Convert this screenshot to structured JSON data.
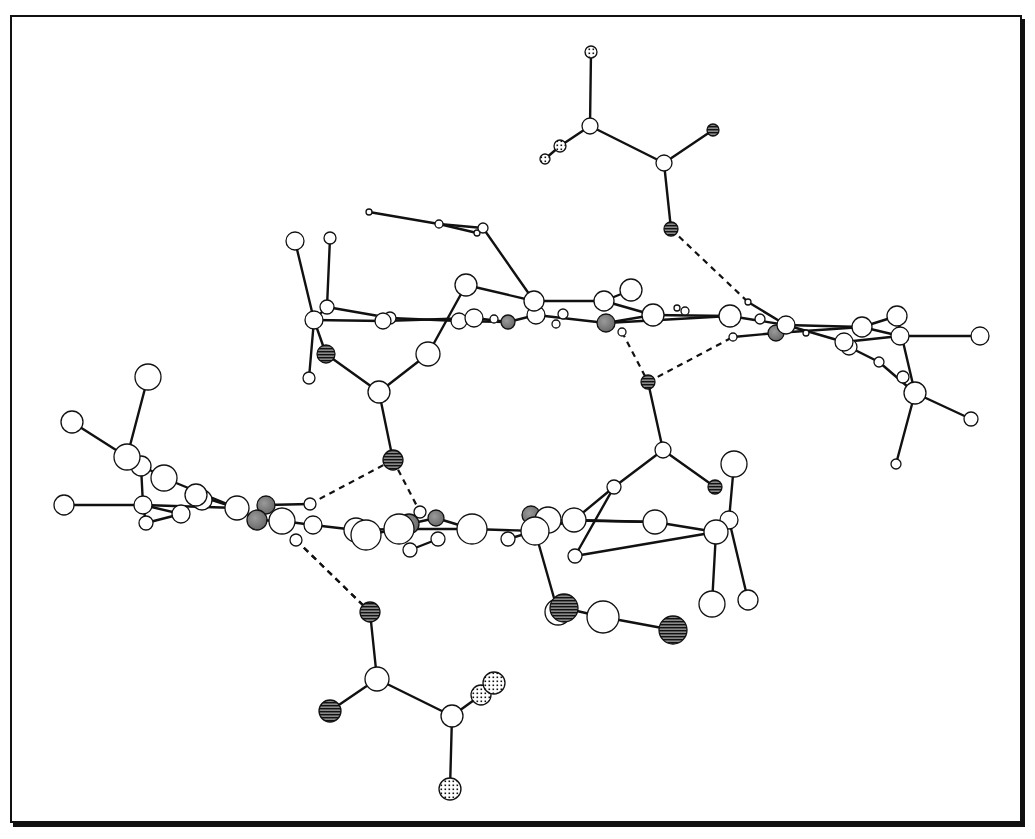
{
  "figure": {
    "caption_fragment": "",
    "colors": {
      "bond": "#111111",
      "atom_fill_plain": "#ffffff",
      "atom_fill_metal": "#7a7a7a",
      "atom_stroke": "#111111",
      "hatch": "#111111",
      "frame": "#111111",
      "hbond": "#111111"
    },
    "legend_atom_types": [
      "plain (C/N/H)",
      "shaded (metal/N)",
      "hatched (O)",
      "dotted (F/halogen)"
    ]
  },
  "atoms": [
    {
      "id": "a1",
      "x": 591,
      "y": 52,
      "r": 6,
      "type": "dotted"
    },
    {
      "id": "a2",
      "x": 590,
      "y": 126,
      "r": 8,
      "type": "plain"
    },
    {
      "id": "a3",
      "x": 560,
      "y": 146,
      "r": 6,
      "type": "dotted"
    },
    {
      "id": "a4",
      "x": 545,
      "y": 159,
      "r": 5,
      "type": "dotted"
    },
    {
      "id": "a5",
      "x": 664,
      "y": 163,
      "r": 8,
      "type": "plain"
    },
    {
      "id": "a6",
      "x": 713,
      "y": 130,
      "r": 6,
      "type": "hatched"
    },
    {
      "id": "a7",
      "x": 671,
      "y": 229,
      "r": 7,
      "type": "hatched"
    },
    {
      "id": "b1",
      "x": 369,
      "y": 212,
      "r": 3,
      "type": "plain"
    },
    {
      "id": "b2",
      "x": 439,
      "y": 224,
      "r": 4,
      "type": "plain"
    },
    {
      "id": "b3",
      "x": 483,
      "y": 228,
      "r": 5,
      "type": "plain"
    },
    {
      "id": "b4",
      "x": 477,
      "y": 233,
      "r": 3,
      "type": "plain"
    },
    {
      "id": "c1",
      "x": 295,
      "y": 241,
      "r": 9,
      "type": "plain"
    },
    {
      "id": "c2",
      "x": 330,
      "y": 238,
      "r": 6,
      "type": "plain"
    },
    {
      "id": "c3",
      "x": 314,
      "y": 320,
      "r": 9,
      "type": "plain"
    },
    {
      "id": "c4",
      "x": 327,
      "y": 307,
      "r": 7,
      "type": "plain"
    },
    {
      "id": "c5",
      "x": 383,
      "y": 321,
      "r": 8,
      "type": "plain"
    },
    {
      "id": "c6",
      "x": 390,
      "y": 318,
      "r": 6,
      "type": "plain"
    },
    {
      "id": "c7",
      "x": 466,
      "y": 285,
      "r": 11,
      "type": "plain"
    },
    {
      "id": "c8",
      "x": 459,
      "y": 321,
      "r": 8,
      "type": "plain"
    },
    {
      "id": "c9",
      "x": 474,
      "y": 318,
      "r": 9,
      "type": "plain"
    },
    {
      "id": "c10",
      "x": 494,
      "y": 319,
      "r": 4,
      "type": "plain"
    },
    {
      "id": "c11",
      "x": 508,
      "y": 322,
      "r": 7,
      "type": "metal"
    },
    {
      "id": "c12",
      "x": 534,
      "y": 301,
      "r": 10,
      "type": "plain"
    },
    {
      "id": "c13",
      "x": 536,
      "y": 315,
      "r": 9,
      "type": "plain"
    },
    {
      "id": "c14",
      "x": 556,
      "y": 324,
      "r": 4,
      "type": "plain"
    },
    {
      "id": "c15",
      "x": 563,
      "y": 314,
      "r": 5,
      "type": "plain"
    },
    {
      "id": "c16",
      "x": 604,
      "y": 301,
      "r": 10,
      "type": "plain"
    },
    {
      "id": "c17",
      "x": 631,
      "y": 290,
      "r": 11,
      "type": "plain"
    },
    {
      "id": "c18",
      "x": 606,
      "y": 323,
      "r": 9,
      "type": "metal"
    },
    {
      "id": "c19",
      "x": 622,
      "y": 332,
      "r": 4,
      "type": "plain"
    },
    {
      "id": "c20",
      "x": 653,
      "y": 315,
      "r": 11,
      "type": "plain"
    },
    {
      "id": "c21",
      "x": 677,
      "y": 308,
      "r": 3,
      "type": "plain"
    },
    {
      "id": "c22",
      "x": 685,
      "y": 311,
      "r": 4,
      "type": "plain"
    },
    {
      "id": "c23",
      "x": 730,
      "y": 316,
      "r": 11,
      "type": "plain"
    },
    {
      "id": "c24",
      "x": 748,
      "y": 302,
      "r": 3,
      "type": "plain"
    },
    {
      "id": "c25",
      "x": 760,
      "y": 319,
      "r": 5,
      "type": "plain"
    },
    {
      "id": "c26",
      "x": 776,
      "y": 333,
      "r": 8,
      "type": "metal"
    },
    {
      "id": "c27",
      "x": 786,
      "y": 325,
      "r": 9,
      "type": "plain"
    },
    {
      "id": "c28",
      "x": 733,
      "y": 337,
      "r": 4,
      "type": "plain"
    },
    {
      "id": "c29",
      "x": 806,
      "y": 333,
      "r": 3,
      "type": "plain"
    },
    {
      "id": "c30",
      "x": 862,
      "y": 327,
      "r": 10,
      "type": "plain"
    },
    {
      "id": "c31",
      "x": 897,
      "y": 316,
      "r": 10,
      "type": "plain"
    },
    {
      "id": "c32",
      "x": 900,
      "y": 336,
      "r": 9,
      "type": "plain"
    },
    {
      "id": "c33",
      "x": 844,
      "y": 342,
      "r": 9,
      "type": "plain"
    },
    {
      "id": "c34",
      "x": 849,
      "y": 347,
      "r": 8,
      "type": "plain"
    },
    {
      "id": "c35",
      "x": 879,
      "y": 362,
      "r": 5,
      "type": "plain"
    },
    {
      "id": "c36",
      "x": 903,
      "y": 377,
      "r": 6,
      "type": "plain"
    },
    {
      "id": "c37",
      "x": 915,
      "y": 393,
      "r": 11,
      "type": "plain"
    },
    {
      "id": "c38",
      "x": 980,
      "y": 336,
      "r": 9,
      "type": "plain"
    },
    {
      "id": "c39",
      "x": 971,
      "y": 419,
      "r": 7,
      "type": "plain"
    },
    {
      "id": "c40",
      "x": 896,
      "y": 464,
      "r": 5,
      "type": "plain"
    },
    {
      "id": "d1",
      "x": 326,
      "y": 354,
      "r": 9,
      "type": "hatched"
    },
    {
      "id": "d2",
      "x": 309,
      "y": 378,
      "r": 6,
      "type": "plain"
    },
    {
      "id": "d3",
      "x": 428,
      "y": 354,
      "r": 12,
      "type": "plain"
    },
    {
      "id": "d4",
      "x": 379,
      "y": 392,
      "r": 11,
      "type": "plain"
    },
    {
      "id": "d5",
      "x": 393,
      "y": 460,
      "r": 10,
      "type": "hatched"
    },
    {
      "id": "d6",
      "x": 648,
      "y": 382,
      "r": 7,
      "type": "hatched"
    },
    {
      "id": "d7",
      "x": 663,
      "y": 450,
      "r": 8,
      "type": "plain"
    },
    {
      "id": "d8",
      "x": 614,
      "y": 487,
      "r": 7,
      "type": "plain"
    },
    {
      "id": "d9",
      "x": 715,
      "y": 487,
      "r": 7,
      "type": "hatched"
    },
    {
      "id": "d10",
      "x": 734,
      "y": 464,
      "r": 13,
      "type": "plain"
    },
    {
      "id": "e1",
      "x": 148,
      "y": 377,
      "r": 13,
      "type": "plain"
    },
    {
      "id": "e2",
      "x": 72,
      "y": 422,
      "r": 11,
      "type": "plain"
    },
    {
      "id": "e3",
      "x": 127,
      "y": 457,
      "r": 13,
      "type": "plain"
    },
    {
      "id": "e4",
      "x": 141,
      "y": 466,
      "r": 10,
      "type": "plain"
    },
    {
      "id": "e5",
      "x": 164,
      "y": 478,
      "r": 13,
      "type": "plain"
    },
    {
      "id": "e6",
      "x": 196,
      "y": 495,
      "r": 11,
      "type": "plain"
    },
    {
      "id": "e7",
      "x": 202,
      "y": 500,
      "r": 10,
      "type": "plain"
    },
    {
      "id": "e8",
      "x": 64,
      "y": 505,
      "r": 10,
      "type": "plain"
    },
    {
      "id": "e9",
      "x": 143,
      "y": 505,
      "r": 9,
      "type": "plain"
    },
    {
      "id": "e10",
      "x": 181,
      "y": 514,
      "r": 9,
      "type": "plain"
    },
    {
      "id": "e11",
      "x": 146,
      "y": 523,
      "r": 7,
      "type": "plain"
    },
    {
      "id": "e12",
      "x": 237,
      "y": 508,
      "r": 12,
      "type": "plain"
    },
    {
      "id": "e13",
      "x": 266,
      "y": 505,
      "r": 9,
      "type": "metal"
    },
    {
      "id": "e14",
      "x": 257,
      "y": 520,
      "r": 10,
      "type": "metal"
    },
    {
      "id": "e15",
      "x": 282,
      "y": 521,
      "r": 13,
      "type": "plain"
    },
    {
      "id": "e16",
      "x": 310,
      "y": 504,
      "r": 6,
      "type": "plain"
    },
    {
      "id": "e17",
      "x": 296,
      "y": 540,
      "r": 6,
      "type": "plain"
    },
    {
      "id": "e18",
      "x": 313,
      "y": 525,
      "r": 9,
      "type": "plain"
    },
    {
      "id": "e19",
      "x": 356,
      "y": 530,
      "r": 12,
      "type": "plain"
    },
    {
      "id": "e20",
      "x": 366,
      "y": 535,
      "r": 15,
      "type": "plain"
    },
    {
      "id": "e21",
      "x": 399,
      "y": 529,
      "r": 15,
      "type": "plain"
    },
    {
      "id": "e22",
      "x": 409,
      "y": 524,
      "r": 10,
      "type": "metal"
    },
    {
      "id": "e23",
      "x": 420,
      "y": 512,
      "r": 6,
      "type": "plain"
    },
    {
      "id": "e24",
      "x": 436,
      "y": 518,
      "r": 8,
      "type": "metal"
    },
    {
      "id": "e25",
      "x": 438,
      "y": 539,
      "r": 7,
      "type": "plain"
    },
    {
      "id": "e26",
      "x": 410,
      "y": 550,
      "r": 7,
      "type": "plain"
    },
    {
      "id": "e27",
      "x": 472,
      "y": 529,
      "r": 15,
      "type": "plain"
    },
    {
      "id": "e28",
      "x": 508,
      "y": 539,
      "r": 7,
      "type": "plain"
    },
    {
      "id": "e29",
      "x": 531,
      "y": 515,
      "r": 9,
      "type": "metal"
    },
    {
      "id": "e30",
      "x": 548,
      "y": 520,
      "r": 13,
      "type": "plain"
    },
    {
      "id": "e31",
      "x": 535,
      "y": 531,
      "r": 14,
      "type": "plain"
    },
    {
      "id": "e32",
      "x": 574,
      "y": 520,
      "r": 12,
      "type": "plain"
    },
    {
      "id": "e33",
      "x": 575,
      "y": 556,
      "r": 7,
      "type": "plain"
    },
    {
      "id": "e34",
      "x": 655,
      "y": 522,
      "r": 12,
      "type": "plain"
    },
    {
      "id": "e35",
      "x": 729,
      "y": 520,
      "r": 9,
      "type": "plain"
    },
    {
      "id": "e36",
      "x": 716,
      "y": 532,
      "r": 12,
      "type": "plain"
    },
    {
      "id": "e37",
      "x": 712,
      "y": 604,
      "r": 13,
      "type": "plain"
    },
    {
      "id": "e38",
      "x": 748,
      "y": 600,
      "r": 10,
      "type": "plain"
    },
    {
      "id": "f1",
      "x": 558,
      "y": 612,
      "r": 13,
      "type": "plain"
    },
    {
      "id": "f2",
      "x": 564,
      "y": 608,
      "r": 14,
      "type": "hatched"
    },
    {
      "id": "f3",
      "x": 603,
      "y": 617,
      "r": 16,
      "type": "plain"
    },
    {
      "id": "f4",
      "x": 673,
      "y": 630,
      "r": 14,
      "type": "hatched"
    },
    {
      "id": "g1",
      "x": 370,
      "y": 612,
      "r": 10,
      "type": "hatched"
    },
    {
      "id": "g2",
      "x": 377,
      "y": 679,
      "r": 12,
      "type": "plain"
    },
    {
      "id": "g3",
      "x": 330,
      "y": 711,
      "r": 11,
      "type": "hatched"
    },
    {
      "id": "g4",
      "x": 452,
      "y": 716,
      "r": 11,
      "type": "plain"
    },
    {
      "id": "g5",
      "x": 481,
      "y": 695,
      "r": 10,
      "type": "dotted"
    },
    {
      "id": "g6",
      "x": 494,
      "y": 683,
      "r": 11,
      "type": "dotted"
    },
    {
      "id": "g7",
      "x": 450,
      "y": 789,
      "r": 11,
      "type": "dotted"
    }
  ],
  "bonds": [
    [
      "a1",
      "a2"
    ],
    [
      "a2",
      "a3"
    ],
    [
      "a3",
      "a4"
    ],
    [
      "a2",
      "a5"
    ],
    [
      "a5",
      "a6"
    ],
    [
      "a5",
      "a7"
    ],
    [
      "b1",
      "b2"
    ],
    [
      "b2",
      "b3"
    ],
    [
      "b2",
      "b4"
    ],
    [
      "b3",
      "c12"
    ],
    [
      "c1",
      "c3"
    ],
    [
      "c2",
      "c4"
    ],
    [
      "c3",
      "c4"
    ],
    [
      "c3",
      "c5"
    ],
    [
      "c4",
      "c6"
    ],
    [
      "c3",
      "d1"
    ],
    [
      "d1",
      "d4"
    ],
    [
      "d2",
      "c3"
    ],
    [
      "c5",
      "c9"
    ],
    [
      "c6",
      "c8"
    ],
    [
      "c8",
      "c11"
    ],
    [
      "c9",
      "c11"
    ],
    [
      "c7",
      "c12"
    ],
    [
      "c7",
      "d3"
    ],
    [
      "d3",
      "d4"
    ],
    [
      "d4",
      "d5"
    ],
    [
      "c12",
      "c16"
    ],
    [
      "c13",
      "c18"
    ],
    [
      "c11",
      "c13"
    ],
    [
      "c16",
      "c20"
    ],
    [
      "c17",
      "c16"
    ],
    [
      "c18",
      "c20"
    ],
    [
      "c18",
      "c23"
    ],
    [
      "c20",
      "c23"
    ],
    [
      "c23",
      "c27"
    ],
    [
      "c24",
      "c27"
    ],
    [
      "c28",
      "c26"
    ],
    [
      "c26",
      "c30"
    ],
    [
      "c27",
      "c30"
    ],
    [
      "c27",
      "c33"
    ],
    [
      "c30",
      "c31"
    ],
    [
      "c30",
      "c32"
    ],
    [
      "c32",
      "c38"
    ],
    [
      "c33",
      "c32"
    ],
    [
      "c34",
      "c35"
    ],
    [
      "c35",
      "c37"
    ],
    [
      "c31",
      "c37"
    ],
    [
      "c37",
      "c39"
    ],
    [
      "c37",
      "c40"
    ],
    [
      "d6",
      "d7"
    ],
    [
      "d7",
      "d8"
    ],
    [
      "d7",
      "d9"
    ],
    [
      "d8",
      "e32"
    ],
    [
      "d8",
      "e33"
    ],
    [
      "d10",
      "e35"
    ],
    [
      "e1",
      "e3"
    ],
    [
      "e2",
      "e3"
    ],
    [
      "e3",
      "e5"
    ],
    [
      "e4",
      "e9"
    ],
    [
      "e5",
      "e12"
    ],
    [
      "e6",
      "e12"
    ],
    [
      "e8",
      "e9"
    ],
    [
      "e9",
      "e10"
    ],
    [
      "e9",
      "e12"
    ],
    [
      "e9",
      "e11"
    ],
    [
      "e10",
      "e11"
    ],
    [
      "e12",
      "e14"
    ],
    [
      "e13",
      "e16"
    ],
    [
      "e14",
      "e15"
    ],
    [
      "e15",
      "e18"
    ],
    [
      "e18",
      "e19"
    ],
    [
      "e19",
      "e21"
    ],
    [
      "e20",
      "e21"
    ],
    [
      "e21",
      "e27"
    ],
    [
      "e22",
      "e24"
    ],
    [
      "e24",
      "e27"
    ],
    [
      "e25",
      "e26"
    ],
    [
      "e27",
      "e31"
    ],
    [
      "e28",
      "e31"
    ],
    [
      "e31",
      "e32"
    ],
    [
      "e30",
      "e34"
    ],
    [
      "e32",
      "e34"
    ],
    [
      "e34",
      "e36"
    ],
    [
      "e33",
      "e36"
    ],
    [
      "e36",
      "e35"
    ],
    [
      "e36",
      "e37"
    ],
    [
      "e35",
      "e38"
    ],
    [
      "e31",
      "f1"
    ],
    [
      "f2",
      "f3"
    ],
    [
      "f3",
      "f4"
    ],
    [
      "g1",
      "g2"
    ],
    [
      "g2",
      "g3"
    ],
    [
      "g2",
      "g4"
    ],
    [
      "g4",
      "g5"
    ],
    [
      "g5",
      "g6"
    ],
    [
      "g4",
      "g7"
    ]
  ],
  "hbonds": [
    [
      "a7",
      "c24"
    ],
    [
      "c19",
      "d6"
    ],
    [
      "d6",
      "c28"
    ],
    [
      "d5",
      "e16"
    ],
    [
      "d5",
      "e23"
    ],
    [
      "e17",
      "g1"
    ],
    [
      "e17",
      "g1"
    ]
  ]
}
